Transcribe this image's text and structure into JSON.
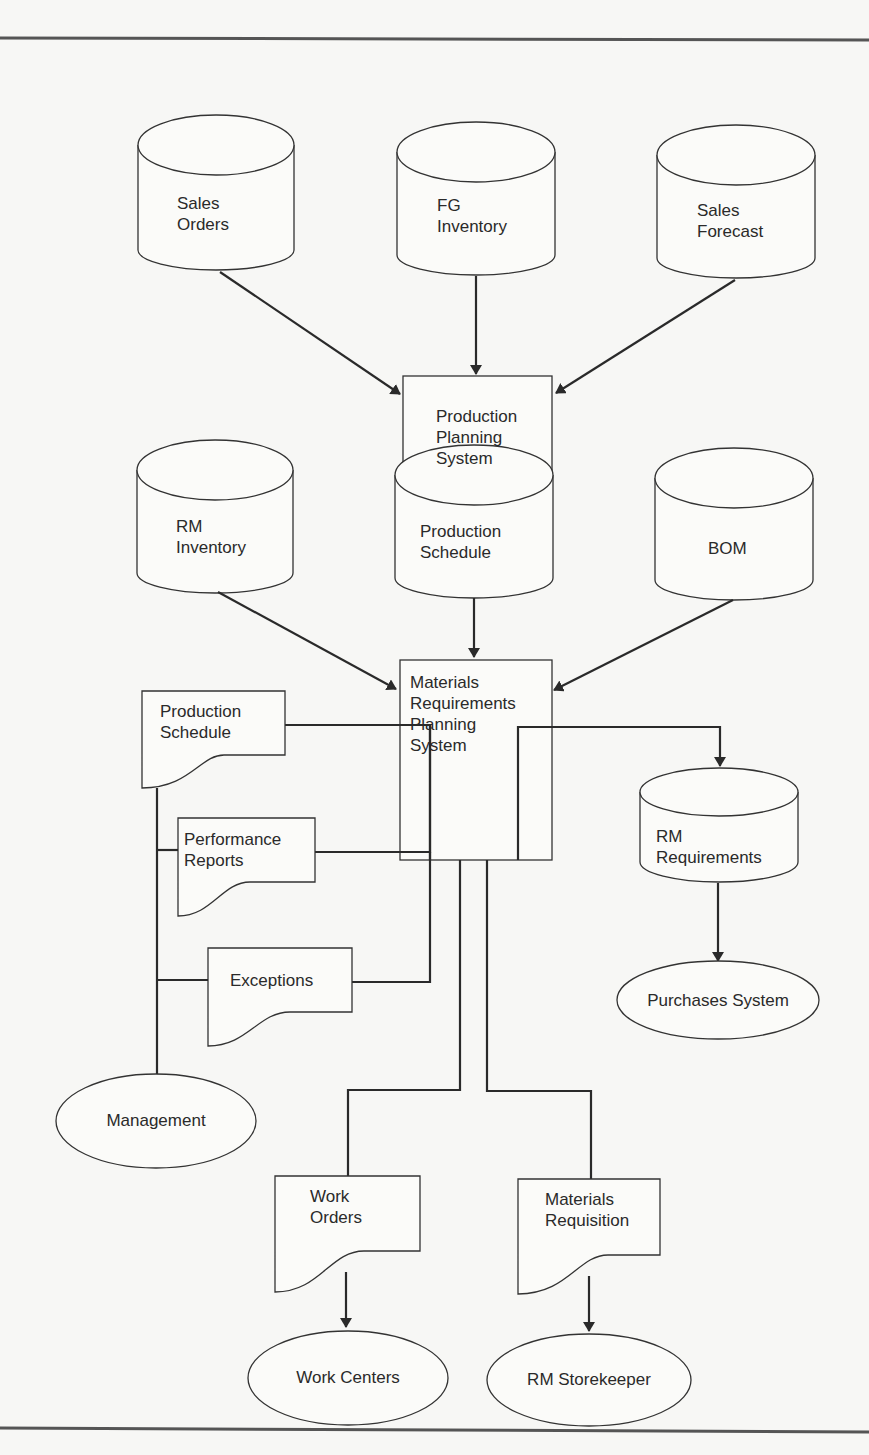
{
  "diagram": {
    "type": "system-flowchart",
    "title": "",
    "data_stores_top": [
      {
        "id": "sales-orders",
        "label": "Sales\nOrders"
      },
      {
        "id": "fg-inventory",
        "label": "FG\nInventory"
      },
      {
        "id": "sales-forecast",
        "label": "Sales\nForecast"
      }
    ],
    "process_1": {
      "id": "production-planning-system",
      "label": "Production\nPlanning\nSystem"
    },
    "data_stores_middle": [
      {
        "id": "rm-inventory",
        "label": "RM\nInventory"
      },
      {
        "id": "production-schedule-store",
        "label": "Production\nSchedule"
      },
      {
        "id": "bom",
        "label": "BOM"
      }
    ],
    "process_2": {
      "id": "mrp-system",
      "label": "Materials\nRequirements\nPlanning\nSystem"
    },
    "documents": [
      {
        "id": "production-schedule-doc",
        "label": "Production\nSchedule"
      },
      {
        "id": "performance-reports",
        "label": "Performance\nReports"
      },
      {
        "id": "exceptions",
        "label": "Exceptions"
      },
      {
        "id": "work-orders",
        "label": "Work\nOrders"
      },
      {
        "id": "materials-requisition",
        "label": "Materials\nRequisition"
      }
    ],
    "output_store": {
      "id": "rm-requirements",
      "label": "RM\nRequirements"
    },
    "terminals": [
      {
        "id": "management",
        "label": "Management"
      },
      {
        "id": "work-centers",
        "label": "Work Centers"
      },
      {
        "id": "rm-storekeeper",
        "label": "RM Storekeeper"
      },
      {
        "id": "purchases-system",
        "label": "Purchases System"
      }
    ],
    "edges": [
      [
        "sales-orders",
        "production-planning-system"
      ],
      [
        "fg-inventory",
        "production-planning-system"
      ],
      [
        "sales-forecast",
        "production-planning-system"
      ],
      [
        "production-planning-system",
        "production-schedule-store"
      ],
      [
        "rm-inventory",
        "mrp-system"
      ],
      [
        "production-schedule-store",
        "mrp-system"
      ],
      [
        "bom",
        "mrp-system"
      ],
      [
        "mrp-system",
        "production-schedule-doc"
      ],
      [
        "mrp-system",
        "performance-reports"
      ],
      [
        "mrp-system",
        "exceptions"
      ],
      [
        "production-schedule-doc",
        "management"
      ],
      [
        "performance-reports",
        "management"
      ],
      [
        "exceptions",
        "management"
      ],
      [
        "mrp-system",
        "work-orders"
      ],
      [
        "work-orders",
        "work-centers"
      ],
      [
        "mrp-system",
        "materials-requisition"
      ],
      [
        "materials-requisition",
        "rm-storekeeper"
      ],
      [
        "mrp-system",
        "rm-requirements"
      ],
      [
        "rm-requirements",
        "purchases-system"
      ]
    ]
  }
}
